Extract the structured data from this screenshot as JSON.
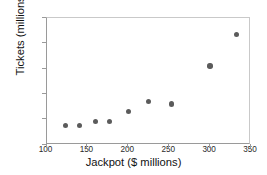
{
  "chart_data": {
    "type": "scatter",
    "title": "",
    "xlabel": "Jackpot ($ millions)",
    "ylabel": "Tickets (millions)",
    "xlim": [
      100,
      350
    ],
    "ylim": [
      10,
      60
    ],
    "xticks": [
      100,
      150,
      200,
      250,
      300,
      350
    ],
    "yticks": [
      10,
      20,
      30,
      40,
      50,
      60
    ],
    "xtick_labels": [
      "100",
      "150",
      "200",
      "250",
      "300",
      "350"
    ],
    "ytick_labels": [
      "10",
      "20",
      "30",
      "40",
      "50",
      "60"
    ],
    "grid": false,
    "legend": null,
    "marker_color": "#5b5b5b",
    "axis_color": "#9a9a9a",
    "background_color": "#ffffff",
    "points": [
      {
        "x": 123,
        "y": 17.4
      },
      {
        "x": 140,
        "y": 17.4
      },
      {
        "x": 160,
        "y": 19.0
      },
      {
        "x": 177,
        "y": 19.0
      },
      {
        "x": 200,
        "y": 23.0
      },
      {
        "x": 225,
        "y": 27.0
      },
      {
        "x": 253,
        "y": 26.0
      },
      {
        "x": 300,
        "y": 41.0
      },
      {
        "x": 332,
        "y": 53.5
      }
    ]
  }
}
